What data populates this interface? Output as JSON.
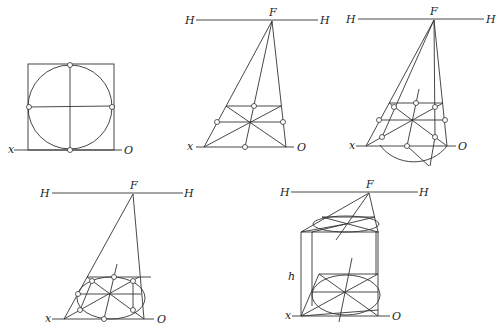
{
  "figures": [
    {
      "id": "fig1",
      "description": "Circle inscribed in a square with diameters, resting on ground line",
      "labels": {
        "x": "x",
        "O": "O"
      }
    },
    {
      "id": "fig2",
      "description": "Square in perspective on ground plane with diagonals and midpoints",
      "labels": {
        "H_left": "H",
        "H_right": "H",
        "F": "F",
        "x": "x",
        "O": "O"
      }
    },
    {
      "id": "fig3",
      "description": "Perspective square with 8 construction points and auxiliary semicircle below ground line",
      "labels": {
        "H_left": "H",
        "H_right": "H",
        "F": "F",
        "x": "x",
        "O": "O"
      }
    },
    {
      "id": "fig4",
      "description": "Circle in perspective as ellipse through 8 points",
      "labels": {
        "H_left": "H",
        "H_right": "H",
        "F": "F",
        "x": "x",
        "O": "O"
      }
    },
    {
      "id": "fig5",
      "description": "Cylinder in perspective of height h with top and bottom ellipses",
      "labels": {
        "H_left": "H",
        "H_right": "H",
        "F": "F",
        "x": "x",
        "O": "O",
        "h": "h"
      }
    }
  ]
}
